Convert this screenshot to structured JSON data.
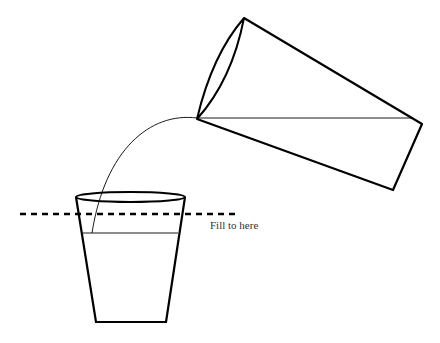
{
  "diagram": {
    "annotation": "Fill to here",
    "colors": {
      "stroke": "#000000",
      "text": "#333333",
      "background": "#ffffff"
    },
    "elements": [
      "pouring-glass",
      "water-stream",
      "receiving-cup",
      "fill-line"
    ]
  }
}
